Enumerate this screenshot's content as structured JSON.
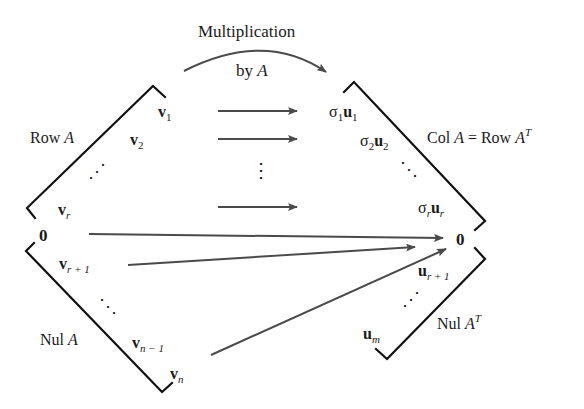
{
  "title": {
    "line1": "Multiplication",
    "line2_prefix": "by ",
    "line2_var": "A"
  },
  "left": {
    "row_space_label": {
      "text": "Row ",
      "var": "A"
    },
    "null_space_label": {
      "text": "Nul ",
      "var": "A"
    },
    "vectors": [
      {
        "sym": "v",
        "sub": "1"
      },
      {
        "sym": "v",
        "sub": "2"
      },
      {
        "sym": "v",
        "sub": "r"
      },
      {
        "sym": "v",
        "sub": "r + 1"
      },
      {
        "sym": "v",
        "sub": "n − 1"
      },
      {
        "sym": "v",
        "sub": "n"
      }
    ],
    "zero": "0",
    "ellipsis_upper": "⋰",
    "ellipsis_lower": "⋱"
  },
  "right": {
    "col_space_label": {
      "text1": "Col ",
      "var1": "A",
      "text2": " = Row ",
      "var2": "A",
      "sup": "T"
    },
    "left_null_label": {
      "text": "Nul ",
      "var": "A",
      "sup": "T"
    },
    "images": [
      {
        "sigma": "σ",
        "sigma_sub": "1",
        "sym": "u",
        "sub": "1"
      },
      {
        "sigma": "σ",
        "sigma_sub": "2",
        "sym": "u",
        "sub": "2"
      },
      {
        "sigma": "σ",
        "sigma_sub": "r",
        "sym": "u",
        "sub": "r"
      }
    ],
    "left_null_vectors": [
      {
        "sym": "u",
        "sub": "r + 1"
      },
      {
        "sym": "u",
        "sub": "m"
      }
    ],
    "zero": "0",
    "ellipsis_upper": "⋱",
    "ellipsis_lower": "⋰"
  },
  "middle": {
    "vertical_ellipsis": "⋮"
  },
  "colors": {
    "bracket": "#111111",
    "arrow": "#4a4a4a",
    "text": "#1a1a1a"
  }
}
